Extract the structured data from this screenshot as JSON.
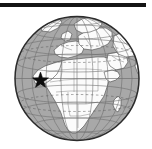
{
  "figure": {
    "caption": "",
    "alt_text": "Globe showing Africa with a star marking a location in West Africa",
    "width_px": 152,
    "height_px": 149
  },
  "rule": {
    "name": "top-horizontal-rule",
    "color": "#141414",
    "x": 0,
    "y": 3,
    "width": 146,
    "height": 4
  },
  "globe": {
    "projection": "orthographic",
    "center_x": 77,
    "center_y": 78.5,
    "radius": 62,
    "ocean_color": "#a8a8a8",
    "land_color": "#fbfbfb",
    "outline_color": "#2b2b2b",
    "graticule_color": "#6d6d6d",
    "border_color": "#7a7a7a",
    "graticule_spacing_degrees": 15,
    "center_lon": 18,
    "center_lat": 12,
    "label": "Earth globe centered on Africa"
  },
  "marker": {
    "type": "star",
    "name": "location-star-marker",
    "color": "#0d0d0d",
    "x": 40.5,
    "y": 80.5,
    "outer_radius": 8.4,
    "inner_radius": 3.4,
    "points": 5,
    "region": "West Africa"
  },
  "regions": [
    {
      "name": "Europe"
    },
    {
      "name": "Africa"
    },
    {
      "name": "Middle East"
    },
    {
      "name": "Asia"
    },
    {
      "name": "Madagascar"
    }
  ]
}
